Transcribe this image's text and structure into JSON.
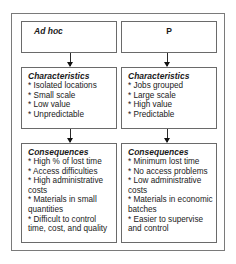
{
  "columns": [
    {
      "title": "Ad hoc",
      "characteristics": {
        "heading": "Characteristics",
        "items": [
          "* Isolated locations",
          "* Small scale",
          "* Low value",
          "* Unpredictable"
        ]
      },
      "consequences": {
        "heading": "Consequences",
        "items": [
          "* High % of lost time",
          "* Access difficulties",
          "* High administrative costs",
          "* Materials in small quantities",
          "* Difficult to control time, cost, and quality"
        ]
      }
    },
    {
      "title": "P",
      "characteristics": {
        "heading": "Characteristics",
        "items": [
          "* Jobs grouped",
          "* Large scale",
          "* High value",
          "* Predictable"
        ]
      },
      "consequences": {
        "heading": "Consequences",
        "items": [
          "* Minimum lost time",
          "* No access problems",
          "* Low administrative costs",
          "* Materials in economic batches",
          "* Easier to supervise and control"
        ]
      }
    }
  ],
  "colors": {
    "border": "#6a6a6a",
    "outer_border": "#7a7a7a",
    "text": "#1a1a1a",
    "background": "#ffffff"
  }
}
